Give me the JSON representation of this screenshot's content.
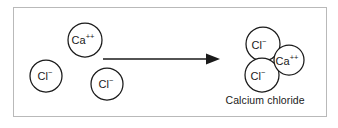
{
  "figure": {
    "kind": "chemical-reaction-diagram",
    "border_color": "#b9b9b9",
    "background_color": "#ffffff",
    "ink_color": "#1a1a1a"
  },
  "reactants": {
    "label": "reactants",
    "species": [
      {
        "id": "calcium-ion",
        "symbol": "Ca",
        "charge": "++",
        "cx": 85,
        "cy": 40,
        "r": 17
      },
      {
        "id": "chloride-ion-left",
        "symbol": "Cl",
        "charge": "−",
        "cx": 46,
        "cy": 76,
        "r": 16
      },
      {
        "id": "chloride-ion-middle",
        "symbol": "Cl",
        "charge": "−",
        "cx": 107,
        "cy": 84,
        "r": 16
      }
    ]
  },
  "reaction_arrow": {
    "id": "reaction-arrow",
    "direction": "right",
    "x_start": 103,
    "x_end": 220,
    "y": 59
  },
  "product": {
    "caption": "Calcium chloride",
    "caption_x": 265,
    "caption_y": 100,
    "species": [
      {
        "id": "chloride-ion-top",
        "symbol": "Cl",
        "charge": "−",
        "cx": 263,
        "cy": 44,
        "r": 17
      },
      {
        "id": "calcium-ion-product",
        "symbol": "Ca",
        "charge": "++",
        "cx": 289,
        "cy": 60,
        "r": 15
      },
      {
        "id": "chloride-ion-bottom",
        "symbol": "Cl",
        "charge": "−",
        "cx": 262,
        "cy": 75,
        "r": 17
      }
    ]
  }
}
